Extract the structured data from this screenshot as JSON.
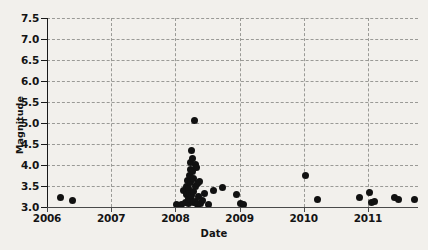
{
  "chart": {
    "type": "scatter",
    "title": "",
    "xlabel": "Date",
    "ylabel": "Magnitude",
    "background_color": "#f2f0ec",
    "marker_color": "#111111",
    "grid": "dashed both axes",
    "legend": "none"
  },
  "axes": {
    "x": {
      "label": "Date",
      "min": 2006.0,
      "max": 2011.78,
      "ticks": [
        "2006",
        "2007",
        "2008",
        "2009",
        "2010",
        "2011"
      ],
      "tick_values": [
        2006,
        2007,
        2008,
        2009,
        2010,
        2011
      ]
    },
    "y": {
      "label": "Magnitude",
      "min": 3.0,
      "max": 7.5,
      "ticks": [
        "3.0",
        "3.5",
        "4.0",
        "4.5",
        "5.0",
        "5.5",
        "6.0",
        "6.5",
        "7.0",
        "7.5"
      ],
      "tick_values": [
        3.0,
        3.5,
        4.0,
        4.5,
        5.0,
        5.5,
        6.0,
        6.5,
        7.0,
        7.5
      ]
    }
  },
  "chart_data": {
    "type": "scatter",
    "title": "",
    "xlabel": "Date",
    "ylabel": "Magnitude",
    "xlim": [
      2006.0,
      2011.78
    ],
    "ylim": [
      3.0,
      7.5
    ],
    "xticks": [
      2006,
      2007,
      2008,
      2009,
      2010,
      2011
    ],
    "xticklabels": [
      "2006",
      "2007",
      "2008",
      "2009",
      "2010",
      "2011"
    ],
    "yticks": [
      3.0,
      3.5,
      4.0,
      4.5,
      5.0,
      5.5,
      6.0,
      6.5,
      7.0,
      7.5
    ],
    "yticklabels": [
      "3.0",
      "3.5",
      "4.0",
      "4.5",
      "5.0",
      "5.5",
      "6.0",
      "6.5",
      "7.0",
      "7.5"
    ],
    "grid": true,
    "legend_position": "none",
    "marker_color": "#111111",
    "n_points": 48,
    "points": [
      {
        "x": 2006.21,
        "y": 3.22
      },
      {
        "x": 2006.4,
        "y": 3.15
      },
      {
        "x": 2008.01,
        "y": 3.05
      },
      {
        "x": 2008.09,
        "y": 3.06
      },
      {
        "x": 2008.13,
        "y": 3.4
      },
      {
        "x": 2008.15,
        "y": 3.11
      },
      {
        "x": 2008.17,
        "y": 3.3
      },
      {
        "x": 2008.18,
        "y": 3.5
      },
      {
        "x": 2008.19,
        "y": 3.62
      },
      {
        "x": 2008.2,
        "y": 3.2
      },
      {
        "x": 2008.2,
        "y": 3.08
      },
      {
        "x": 2008.21,
        "y": 3.44
      },
      {
        "x": 2008.22,
        "y": 3.75
      },
      {
        "x": 2008.22,
        "y": 3.33
      },
      {
        "x": 2008.23,
        "y": 3.9
      },
      {
        "x": 2008.23,
        "y": 3.18
      },
      {
        "x": 2008.24,
        "y": 4.05
      },
      {
        "x": 2008.24,
        "y": 3.58
      },
      {
        "x": 2008.25,
        "y": 4.35
      },
      {
        "x": 2008.25,
        "y": 3.27
      },
      {
        "x": 2008.26,
        "y": 4.16
      },
      {
        "x": 2008.26,
        "y": 3.12
      },
      {
        "x": 2008.27,
        "y": 3.84
      },
      {
        "x": 2008.28,
        "y": 3.68
      },
      {
        "x": 2008.28,
        "y": 3.36
      },
      {
        "x": 2008.29,
        "y": 3.1
      },
      {
        "x": 2008.3,
        "y": 5.05
      },
      {
        "x": 2008.31,
        "y": 4.02
      },
      {
        "x": 2008.31,
        "y": 3.48
      },
      {
        "x": 2008.32,
        "y": 3.14
      },
      {
        "x": 2008.33,
        "y": 3.95
      },
      {
        "x": 2008.34,
        "y": 3.55
      },
      {
        "x": 2008.35,
        "y": 3.07
      },
      {
        "x": 2008.36,
        "y": 3.24
      },
      {
        "x": 2008.38,
        "y": 3.6
      },
      {
        "x": 2008.39,
        "y": 3.09
      },
      {
        "x": 2008.42,
        "y": 3.16
      },
      {
        "x": 2008.46,
        "y": 3.32
      },
      {
        "x": 2008.52,
        "y": 3.06
      },
      {
        "x": 2008.6,
        "y": 3.4
      },
      {
        "x": 2008.74,
        "y": 3.47
      },
      {
        "x": 2008.96,
        "y": 3.3
      },
      {
        "x": 2009.02,
        "y": 3.09
      },
      {
        "x": 2009.06,
        "y": 3.07
      },
      {
        "x": 2010.02,
        "y": 3.74
      },
      {
        "x": 2010.22,
        "y": 3.18
      },
      {
        "x": 2010.87,
        "y": 3.22
      },
      {
        "x": 2011.02,
        "y": 3.34
      },
      {
        "x": 2011.05,
        "y": 3.1
      },
      {
        "x": 2011.1,
        "y": 3.12
      },
      {
        "x": 2011.42,
        "y": 3.22
      },
      {
        "x": 2011.47,
        "y": 3.17
      },
      {
        "x": 2011.73,
        "y": 3.18
      }
    ]
  }
}
